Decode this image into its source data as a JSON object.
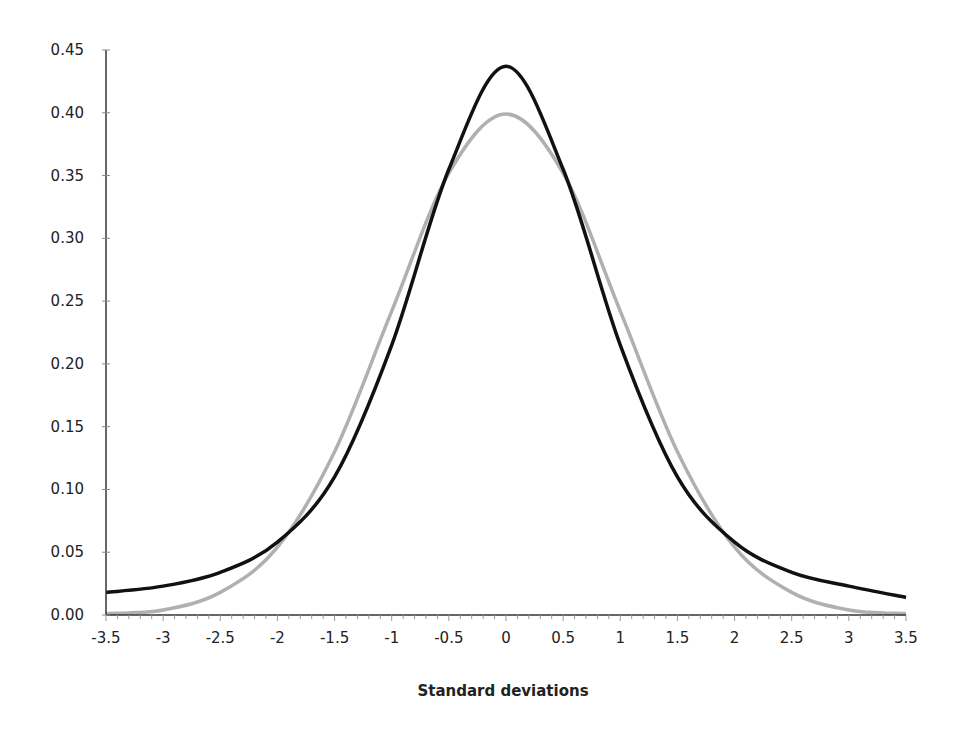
{
  "chart_data": {
    "type": "line",
    "title": "",
    "xlabel": "Standard deviations",
    "ylabel": "",
    "xlim": [
      -3.5,
      3.5
    ],
    "ylim": [
      0,
      0.45
    ],
    "x_ticks": [
      "-3.5",
      "-3",
      "-2.5",
      "-2",
      "-1.5",
      "-1",
      "-0.5",
      "0",
      "0.5",
      "1",
      "1.5",
      "2",
      "2.5",
      "3",
      "3.5"
    ],
    "y_ticks": [
      "0.00",
      "0.05",
      "0.10",
      "0.15",
      "0.20",
      "0.25",
      "0.30",
      "0.35",
      "0.40",
      "0.45"
    ],
    "grid": false,
    "legend": null,
    "x": [
      -3.5,
      -3,
      -2.5,
      -2,
      -1.5,
      -1,
      -0.5,
      0,
      0.5,
      1,
      1.5,
      2,
      2.5,
      3,
      3.5
    ],
    "series": [
      {
        "name": "Normal distribution",
        "color": "#b0b0b0",
        "values": [
          0.001,
          0.004,
          0.018,
          0.054,
          0.13,
          0.242,
          0.352,
          0.399,
          0.352,
          0.242,
          0.13,
          0.054,
          0.018,
          0.004,
          0.001
        ]
      },
      {
        "name": "Fat-tailed distribution",
        "color": "#111111",
        "values": [
          0.018,
          0.023,
          0.034,
          0.058,
          0.11,
          0.215,
          0.355,
          0.437,
          0.355,
          0.215,
          0.11,
          0.058,
          0.034,
          0.023,
          0.014
        ]
      }
    ]
  }
}
